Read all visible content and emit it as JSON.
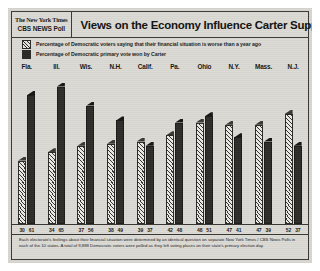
{
  "header": {
    "logo_masthead": "The New York Times",
    "logo_cbs": "CBS NEWS Poll",
    "headline": "Views on the Economy Influence Carter Support"
  },
  "legend": {
    "items": [
      {
        "swatch": "hatched-swatch",
        "label": "Percentage of Democratic voters saying that their financial situation is worse than a year ago"
      },
      {
        "swatch": "solid-swatch",
        "label": "Percentage of Democratic primary vote won by Carter"
      }
    ]
  },
  "footnote": "Each electorate's feelings about their financial situation were determined by an identical question on separate New York Times / CBS News Polls in each of the 10 states. A total of 9,888 Democratic voters were polled as they left voting places on their state's primary election day.",
  "colors": {
    "paper": "#dcdad5",
    "ink": "#2a2926",
    "hatch_fill": "#eceae5",
    "solid_fill": "#2d2c29"
  },
  "chart_data": {
    "type": "bar",
    "title": "Views on the Economy Influence Carter Support",
    "xlabel": "",
    "ylabel": "",
    "ylim": [
      0,
      70
    ],
    "grid": false,
    "legend_position": "top",
    "categories": [
      "Fla.",
      "Ill.",
      "Wis.",
      "N.H.",
      "Calif.",
      "Pa.",
      "Ohio",
      "N.Y.",
      "Mass.",
      "N.J."
    ],
    "series": [
      {
        "name": "Percentage of Democratic voters saying that their financial situation is worse than a year ago",
        "style": "hatched",
        "values": [
          30,
          34,
          37,
          38,
          39,
          42,
          48,
          47,
          47,
          52
        ]
      },
      {
        "name": "Percentage of Democratic primary vote won by Carter",
        "style": "solid",
        "values": [
          61,
          65,
          56,
          49,
          37,
          48,
          51,
          41,
          39,
          37
        ]
      }
    ]
  }
}
